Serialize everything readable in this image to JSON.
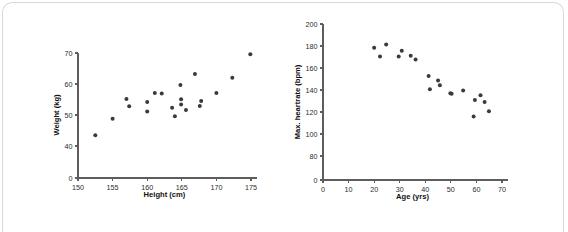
{
  "page": {
    "background": "#ffffff",
    "frame_color": "#d9d9d9",
    "point_color": "#3a3a3a",
    "axis_color": "#5d5d5d",
    "text_color": "#111111"
  },
  "chart_data": [
    {
      "type": "scatter",
      "title": "",
      "xlabel": "Height (cm)",
      "ylabel": "Weight (kg)",
      "xlim": [
        150,
        175
      ],
      "ylim": [
        0,
        70
      ],
      "xticks": [
        150,
        155,
        160,
        165,
        170,
        175
      ],
      "yticks": [
        0,
        40,
        50,
        60,
        70
      ],
      "ytick_labels": [
        "0",
        "40",
        "50",
        "60",
        "70"
      ],
      "xtick_labels": [
        "150",
        "155",
        "160",
        "165",
        "170",
        "175"
      ],
      "grid": false,
      "legend": "none",
      "y_axis_break": true,
      "points": [
        {
          "x": 152.5,
          "y": 43.5
        },
        {
          "x": 155.0,
          "y": 48.8
        },
        {
          "x": 157.0,
          "y": 55.2
        },
        {
          "x": 157.4,
          "y": 52.8
        },
        {
          "x": 160.0,
          "y": 54.2
        },
        {
          "x": 160.0,
          "y": 51.1
        },
        {
          "x": 161.1,
          "y": 57.1
        },
        {
          "x": 162.1,
          "y": 56.9
        },
        {
          "x": 163.6,
          "y": 52.3
        },
        {
          "x": 164.0,
          "y": 49.6
        },
        {
          "x": 164.8,
          "y": 59.7
        },
        {
          "x": 164.9,
          "y": 55.1
        },
        {
          "x": 164.9,
          "y": 53.4
        },
        {
          "x": 165.6,
          "y": 51.6
        },
        {
          "x": 166.9,
          "y": 63.2
        },
        {
          "x": 167.6,
          "y": 52.9
        },
        {
          "x": 167.8,
          "y": 54.5
        },
        {
          "x": 170.0,
          "y": 57.1
        },
        {
          "x": 172.3,
          "y": 62.0
        },
        {
          "x": 174.9,
          "y": 69.6
        }
      ]
    },
    {
      "type": "scatter",
      "title": "",
      "xlabel": "Age (yrs)",
      "ylabel": "Max. heartrate (bpm)",
      "xlim": [
        0,
        70
      ],
      "ylim": [
        0,
        200
      ],
      "xticks": [
        0,
        10,
        20,
        30,
        40,
        50,
        60,
        70
      ],
      "yticks": [
        0,
        80,
        100,
        120,
        140,
        160,
        180,
        200
      ],
      "ytick_labels": [
        "0",
        "80",
        "100",
        "120",
        "140",
        "160",
        "180",
        "200"
      ],
      "xtick_labels": [
        "0",
        "10",
        "20",
        "30",
        "40",
        "50",
        "60",
        "70"
      ],
      "grid": false,
      "legend": "none",
      "y_axis_break": true,
      "points": [
        {
          "x": 20.0,
          "y": 178.5
        },
        {
          "x": 22.3,
          "y": 170.5
        },
        {
          "x": 24.7,
          "y": 181.3
        },
        {
          "x": 29.6,
          "y": 170.5
        },
        {
          "x": 30.8,
          "y": 175.6
        },
        {
          "x": 34.3,
          "y": 171.2
        },
        {
          "x": 36.2,
          "y": 167.8
        },
        {
          "x": 41.3,
          "y": 152.8
        },
        {
          "x": 41.8,
          "y": 140.6
        },
        {
          "x": 45.0,
          "y": 148.7
        },
        {
          "x": 45.7,
          "y": 144.3
        },
        {
          "x": 49.8,
          "y": 137.0
        },
        {
          "x": 50.3,
          "y": 136.6
        },
        {
          "x": 54.8,
          "y": 139.6
        },
        {
          "x": 58.9,
          "y": 116.0
        },
        {
          "x": 59.4,
          "y": 130.8
        },
        {
          "x": 61.6,
          "y": 135.3
        },
        {
          "x": 63.2,
          "y": 129.1
        },
        {
          "x": 64.9,
          "y": 120.6
        }
      ]
    }
  ]
}
